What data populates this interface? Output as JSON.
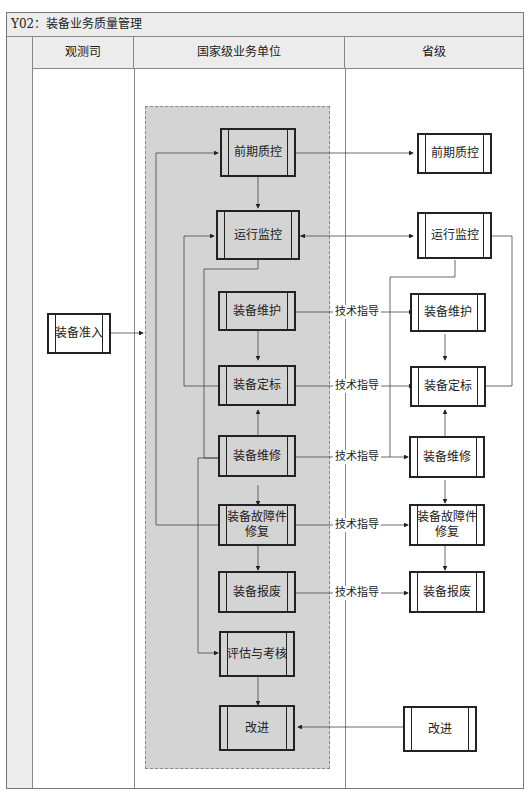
{
  "title": "Y02：装备业务质量管理",
  "lanes": [
    {
      "id": "observation",
      "label": "观测司"
    },
    {
      "id": "national",
      "label": "国家级业务单位"
    },
    {
      "id": "provincial",
      "label": "省级"
    }
  ],
  "nodes": {
    "obs_access": "装备准入",
    "nat_early_qc": "前期质控",
    "nat_monitor": "运行监控",
    "nat_maintain": "装备维护",
    "nat_calibrate": "装备定标",
    "nat_repair": "装备维修",
    "nat_fault_repair": "装备故障件修复",
    "nat_fault_repair_line1": "装备故障件",
    "nat_fault_repair_line2": "修复",
    "nat_scrap": "装备报废",
    "nat_evaluate": "评估与考核",
    "nat_improve": "改进",
    "prov_early_qc": "前期质控",
    "prov_monitor": "运行监控",
    "prov_maintain": "装备维护",
    "prov_calibrate": "装备定标",
    "prov_repair": "装备维修",
    "prov_fault_repair_line1": "装备故障件",
    "prov_fault_repair_line2": "修复",
    "prov_scrap": "装备报废",
    "prov_improve": "改进"
  },
  "edge_labels": {
    "maintain": "技术指导",
    "calibrate": "技术指导",
    "repair": "技术指导",
    "fault_repair": "技术指导",
    "scrap": "技术指导"
  },
  "colors": {
    "gray_region": "#d4d4d4",
    "header_bg": "#ececec",
    "line": "#222222"
  }
}
